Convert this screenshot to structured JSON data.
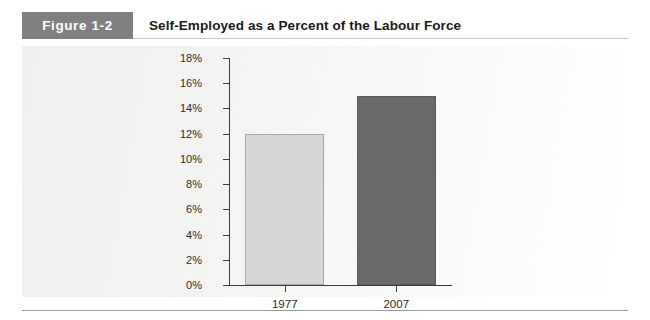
{
  "figure": {
    "badge_label": "Figure 1-2",
    "title": "Self-Employed as a Percent of the Labour Force"
  },
  "colors": {
    "badge_background": "#808080",
    "badge_text": "#ffffff",
    "title_text": "#1a1a1a",
    "panel_background": "#f3f3f1",
    "axis": "#3c3c3c",
    "bar_1977": "#d6d6d4",
    "bar_2007": "#6a6a6a",
    "rule": "#9a9a9a"
  },
  "chart_data": {
    "type": "bar",
    "title": "Self-Employed as a Percent of the Labour Force",
    "categories": [
      "1977",
      "2007"
    ],
    "values": [
      12,
      15
    ],
    "value_suffix": "%",
    "series": [
      {
        "name": "Self-employed share",
        "values": [
          12,
          15
        ]
      }
    ],
    "xlabel": "",
    "ylabel": "",
    "ylim": [
      0,
      18
    ],
    "ytick_step": 2,
    "ytick_labels": [
      "0%",
      "2%",
      "4%",
      "6%",
      "8%",
      "10%",
      "12%",
      "14%",
      "16%",
      "18%"
    ],
    "ytick_values": [
      0,
      2,
      4,
      6,
      8,
      10,
      12,
      14,
      16,
      18
    ],
    "grid": false,
    "legend": false,
    "legend_position": "none",
    "bar_colors": [
      "#d6d6d4",
      "#6a6a6a"
    ]
  }
}
